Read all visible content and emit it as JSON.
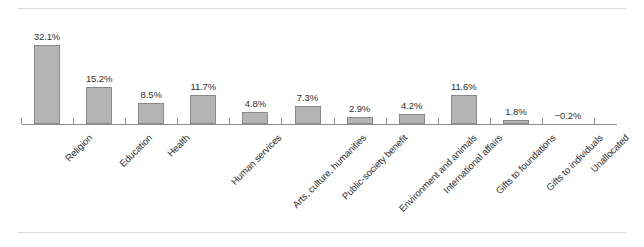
{
  "figure": {
    "rules": {
      "top_visible": true,
      "bottom_visible": true
    },
    "value_suffix": "%"
  },
  "chart_data": {
    "type": "bar",
    "title": "",
    "subtitle": "",
    "xlabel": "",
    "ylabel": "",
    "grid": false,
    "legend": null,
    "ylim": [
      -2,
      35
    ],
    "axis_baseline": 0,
    "orientation": "vertical",
    "bar_color": "#b4b4b4",
    "bar_edge_color": "#8a8a8a",
    "axis_color": "#8d8d8d",
    "label_color": "#2f2f2f",
    "categories": [
      "Religion",
      "Education",
      "Health",
      "Human services",
      "Arts, culture, humanities",
      "Public-society benefit",
      "Environment and animals",
      "International affairs",
      "Gifts to foundations",
      "Gifts to individuals",
      "Unallocated"
    ],
    "values": [
      32.1,
      15.2,
      8.5,
      11.7,
      4.8,
      7.3,
      2.9,
      4.2,
      11.6,
      1.8,
      -0.2
    ],
    "data_labels": [
      "32.1%",
      "15.2%",
      "8.5%",
      "11.7%",
      "4.8%",
      "7.3%",
      "2.9%",
      "4.2%",
      "11.6%",
      "1.8%",
      "−0.2%"
    ]
  }
}
